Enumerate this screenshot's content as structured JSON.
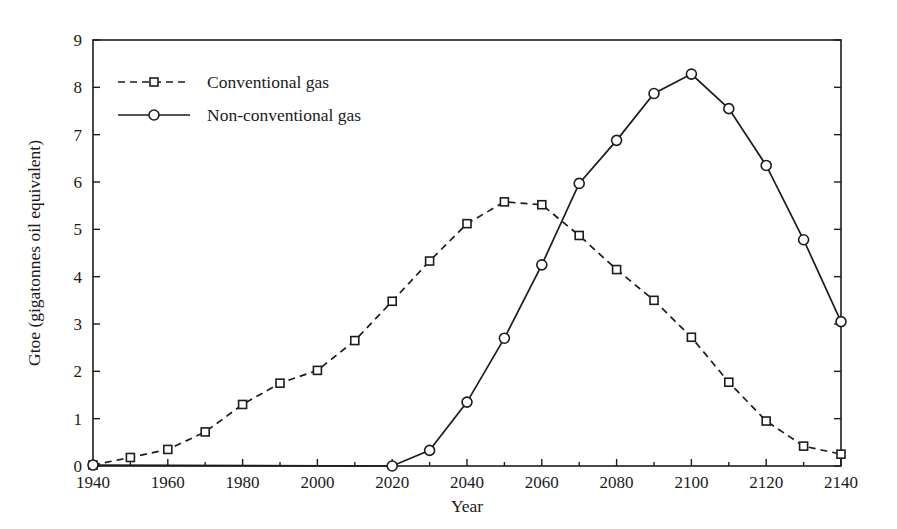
{
  "chart_data": {
    "type": "line",
    "title": "",
    "xlabel": "Year",
    "ylabel": "Gtoe (gigatonnes oil equivalent)",
    "xlim": [
      1940,
      2140
    ],
    "ylim": [
      0,
      9
    ],
    "xticks": [
      1940,
      1960,
      1980,
      2000,
      2020,
      2040,
      2060,
      2080,
      2100,
      2120,
      2140
    ],
    "xtick_labels": [
      "1940",
      "1960",
      "1980",
      "2000",
      "2020",
      "2040",
      "2060",
      "2080",
      "2100",
      "2120",
      "2140"
    ],
    "x_minor_step": 10,
    "yticks": [
      0,
      1,
      2,
      3,
      4,
      5,
      6,
      7,
      8,
      9
    ],
    "ytick_labels": [
      "0",
      "1",
      "2",
      "3",
      "4",
      "5",
      "6",
      "7",
      "8",
      "9"
    ],
    "grid": false,
    "legend_position": "upper-left-inside",
    "frame": "box",
    "x": [
      1940,
      1950,
      1960,
      1970,
      1980,
      1990,
      2000,
      2010,
      2020,
      2030,
      2040,
      2050,
      2060,
      2070,
      2080,
      2090,
      2100,
      2110,
      2120,
      2130,
      2140
    ],
    "series": [
      {
        "name": "Conventional gas",
        "marker": "square",
        "linestyle": "dashed",
        "color": "#1c1c1c",
        "x": [
          1940,
          1950,
          1960,
          1970,
          1980,
          1990,
          2000,
          2010,
          2020,
          2030,
          2040,
          2050,
          2060,
          2070,
          2080,
          2090,
          2100,
          2110,
          2120,
          2130,
          2140
        ],
        "values": [
          0.02,
          0.18,
          0.35,
          0.72,
          1.3,
          1.75,
          2.02,
          2.65,
          3.48,
          4.33,
          5.12,
          5.58,
          5.52,
          4.87,
          4.15,
          3.5,
          2.72,
          1.77,
          0.95,
          0.42,
          0.25
        ]
      },
      {
        "name": "Non-conventional gas",
        "marker": "circle",
        "linestyle": "solid",
        "color": "#1c1c1c",
        "x": [
          1940,
          2020,
          2030,
          2040,
          2050,
          2060,
          2070,
          2080,
          2090,
          2100,
          2110,
          2120,
          2130,
          2140
        ],
        "values": [
          0.02,
          0.0,
          0.33,
          1.35,
          2.7,
          4.25,
          5.97,
          6.88,
          7.87,
          8.28,
          7.55,
          6.35,
          4.78,
          3.05
        ]
      }
    ],
    "legend": [
      {
        "label": "Conventional gas",
        "marker": "square",
        "linestyle": "dashed"
      },
      {
        "label": "Non-conventional gas",
        "marker": "circle",
        "linestyle": "solid"
      }
    ],
    "colors": {
      "ink": "#1c1c1c",
      "background": "#ffffff",
      "marker_fill": "#ffffff"
    }
  }
}
